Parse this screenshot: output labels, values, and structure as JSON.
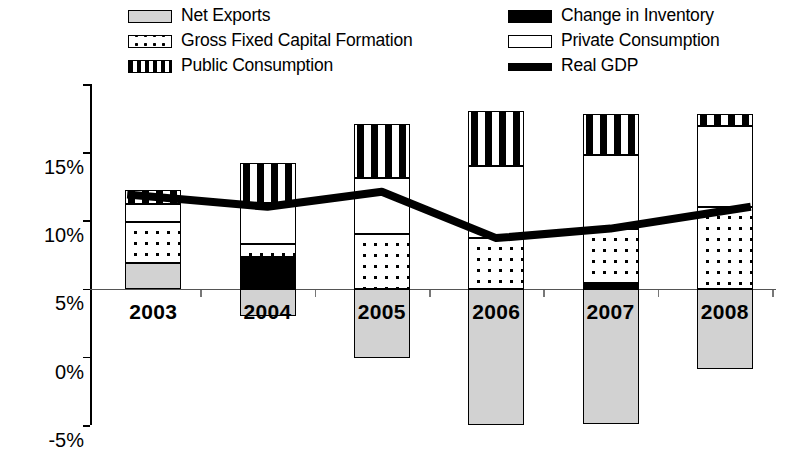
{
  "legend": {
    "left_column": [
      {
        "key": "net_exports",
        "label": "Net Exports",
        "swatch": "net-exports-swatch"
      },
      {
        "key": "gfcf",
        "label": "Gross Fixed Capital Formation",
        "swatch": "gfcf-swatch"
      },
      {
        "key": "public",
        "label": "Public Consumption",
        "swatch": "public-consumption-swatch"
      }
    ],
    "right_column": [
      {
        "key": "inventory",
        "label": "Change in Inventory",
        "swatch": "inventory-swatch"
      },
      {
        "key": "private",
        "label": "Private Consumption",
        "swatch": "private-consumption-swatch"
      },
      {
        "key": "gdp",
        "label": "Real GDP",
        "swatch": "real-gdp-line-swatch"
      }
    ]
  },
  "axis": {
    "y_ticks": [
      "15%",
      "10%",
      "5%",
      "0%",
      "-5%",
      "-10%"
    ],
    "y_values": [
      15,
      10,
      5,
      0,
      -5,
      -10
    ],
    "x_labels": [
      "2003",
      "2004",
      "2005",
      "2006",
      "2007",
      "2008"
    ]
  },
  "colors": {
    "net_exports": "#d2d2d2",
    "inventory": "#000000",
    "private": "#ffffff",
    "gfcf": "#ffffff",
    "public": "#ffffff",
    "gdp_line": "#000000",
    "axis": "#000000"
  },
  "chart_data": {
    "type": "bar",
    "title": "",
    "subtitle": "",
    "xlabel": "",
    "ylabel": "",
    "ylim": [
      -10,
      15
    ],
    "ytick_step": 5,
    "grid": false,
    "stacked": true,
    "legend_position": "top",
    "categories": [
      "2003",
      "2004",
      "2005",
      "2006",
      "2007",
      "2008"
    ],
    "series": [
      {
        "name": "Net Exports",
        "key": "net_exports",
        "values": [
          1.9,
          -2.0,
          -5.1,
          -10.0,
          -9.9,
          -5.9
        ]
      },
      {
        "name": "Change in Inventory",
        "key": "inventory",
        "values": [
          0.0,
          2.3,
          0.0,
          0.0,
          0.4,
          0.0
        ]
      },
      {
        "name": "Gross Fixed Capital Formation",
        "key": "gfcf",
        "values": [
          3.0,
          1.0,
          4.0,
          3.7,
          4.0,
          6.0
        ]
      },
      {
        "name": "Private Consumption",
        "key": "private",
        "values": [
          1.3,
          3.0,
          4.1,
          5.3,
          5.4,
          5.9
        ]
      },
      {
        "name": "Public Consumption",
        "key": "public",
        "values": [
          1.0,
          2.9,
          4.0,
          4.0,
          3.0,
          0.9
        ]
      }
    ],
    "line_series": {
      "name": "Real GDP",
      "key": "gdp",
      "values": [
        6.9,
        6.0,
        7.1,
        3.7,
        4.4,
        6.0
      ]
    },
    "positive_totals": [
      7.2,
      9.2,
      12.1,
      13.0,
      12.8,
      12.8
    ],
    "negative_totals": [
      0.0,
      -2.0,
      -5.1,
      -10.0,
      -9.9,
      -5.9
    ]
  }
}
